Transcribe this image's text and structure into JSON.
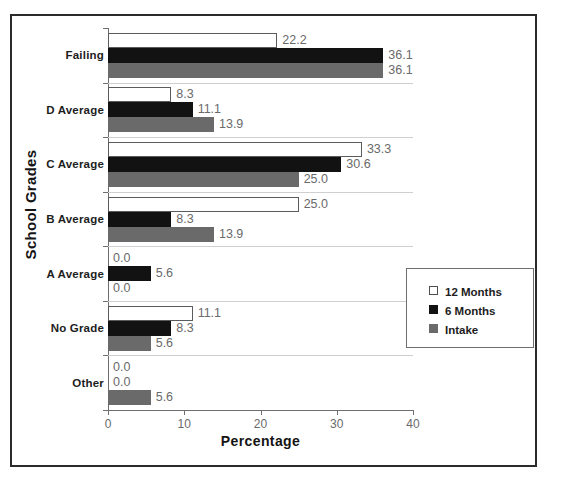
{
  "chart_data": {
    "type": "bar",
    "orientation": "horizontal",
    "title": "",
    "xlabel": "Percentage",
    "ylabel": "School Grades",
    "xlim": [
      0,
      40
    ],
    "xticks": [
      "0",
      "10",
      "20",
      "30",
      "40"
    ],
    "grid": false,
    "legend_position": "center-right",
    "categories": [
      "Failing",
      "D Average",
      "C Average",
      "B Average",
      "A Average",
      "No Grade",
      "Other"
    ],
    "series": [
      {
        "name": "12 Months",
        "color": "#ffffff",
        "values": [
          22.2,
          8.3,
          33.3,
          25.0,
          0.0,
          11.1,
          0.0
        ]
      },
      {
        "name": "6 Months",
        "color": "#121212",
        "values": [
          36.1,
          11.1,
          30.6,
          8.3,
          5.6,
          8.3,
          0.0
        ]
      },
      {
        "name": "Intake",
        "color": "#6a6a6a",
        "values": [
          36.1,
          13.9,
          25.0,
          13.9,
          0.0,
          5.6,
          5.6
        ]
      }
    ],
    "value_labels": [
      [
        "22.2",
        "36.1",
        "36.1"
      ],
      [
        "8.3",
        "11.1",
        "13.9"
      ],
      [
        "33.3",
        "30.6",
        "25.0"
      ],
      [
        "25.0",
        "8.3",
        "13.9"
      ],
      [
        "0.0",
        "5.6",
        "0.0"
      ],
      [
        "11.1",
        "8.3",
        "5.6"
      ],
      [
        "0.0",
        "0.0",
        "5.6"
      ]
    ]
  },
  "legend": {
    "items": [
      {
        "label": "12 Months",
        "swatch": "white-square-icon"
      },
      {
        "label": "6 Months",
        "swatch": "black-square-icon"
      },
      {
        "label": "Intake",
        "swatch": "gray-square-icon"
      }
    ]
  }
}
